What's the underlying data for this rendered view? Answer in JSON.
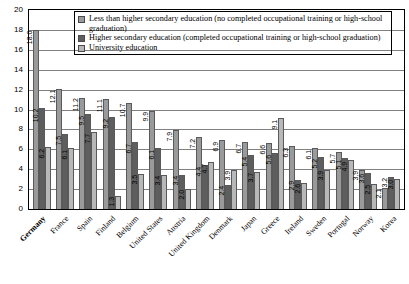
{
  "chart_data": {
    "type": "bar",
    "title": "",
    "xlabel": "",
    "ylabel": "",
    "ylim": [
      0,
      20
    ],
    "ytick_step": 2,
    "yticks": [
      "20",
      "18",
      "16",
      "14",
      "12",
      "10",
      "8",
      "6",
      "4",
      "2",
      "0"
    ],
    "grid": true,
    "legend_position": "top",
    "categories": [
      "Germany",
      "France",
      "Spain",
      "Finland",
      "Belgium",
      "United States",
      "Austria",
      "United Kingdom",
      "Denmark",
      "Japan",
      "Greece",
      "Ireland",
      "Sweden",
      "Portugal",
      "Norway",
      "Korea"
    ],
    "highlighted_category": "Germany",
    "series": [
      {
        "name": "Less than higher secondary education (no completed occupational training or high-school graduation)",
        "color": "#9a9a9a",
        "values": [
          18.0,
          12.1,
          11.2,
          11.1,
          10.7,
          9.9,
          7.9,
          7.2,
          6.9,
          6.7,
          6.6,
          6.3,
          6.1,
          5.7,
          3.9,
          2.1
        ],
        "labels": [
          "18.0",
          "12.1",
          "11.2",
          "11.1",
          "10.7",
          "9.9",
          "7.9",
          "7.2",
          "6.9",
          "6.7",
          "6.6",
          "6.3",
          "6.1",
          "5.7",
          "3.9",
          "2.1"
        ]
      },
      {
        "name": "Higher secondary education (completed occupational training or high-school graduation)",
        "color": "#5e5e5e",
        "values": [
          10.2,
          7.5,
          9.5,
          9.2,
          6.7,
          6.1,
          3.4,
          4.4,
          2.4,
          5.4,
          5.6,
          2.9,
          5.2,
          5.1,
          3.6,
          3.2
        ],
        "labels": [
          "10.2",
          "7.5",
          "9.5",
          "9.2",
          "6.7",
          "6.1",
          "3.4",
          "4.4",
          "2.4",
          "5.4",
          "5.6",
          "2.9",
          "5.2",
          "5.1",
          "3.6",
          "3.2"
        ]
      },
      {
        "name": "University education",
        "color": "#b8b8b8",
        "values": [
          6.2,
          6.1,
          7.7,
          1.3,
          3.5,
          3.4,
          2.0,
          4.7,
          3.9,
          3.7,
          9.1,
          2.6,
          3.9,
          4.9,
          2.5,
          3.0
        ],
        "labels": [
          "6.2",
          "6.1",
          "7.7",
          "1.3",
          "3.5",
          "3.4",
          "2.0",
          "4.7",
          "3.9",
          "3.7",
          "9.1",
          "2.6",
          "3.9",
          "4.9",
          "2.5",
          "3.0"
        ]
      }
    ]
  },
  "legend": {
    "items": [
      "Less than higher secondary education (no completed occupational training or high-school graduation)",
      "Higher secondary education (completed occupational training or high-school graduation)",
      "University education"
    ]
  }
}
